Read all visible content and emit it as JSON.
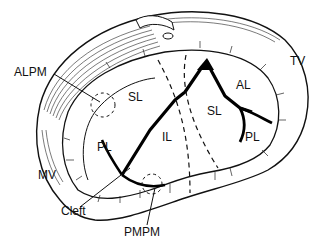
{
  "diagram": {
    "labels": {
      "alpm": "ALPM",
      "tv": "TV",
      "sl_left": "SL",
      "al": "AL",
      "sl_right": "SL",
      "il": "IL",
      "pl_left": "PL",
      "pl_right": "PL",
      "mv": "MV",
      "cleft": "Cleft",
      "pmpm": "PMPM"
    },
    "colors": {
      "ink": "#111111",
      "background": "#ffffff"
    }
  }
}
